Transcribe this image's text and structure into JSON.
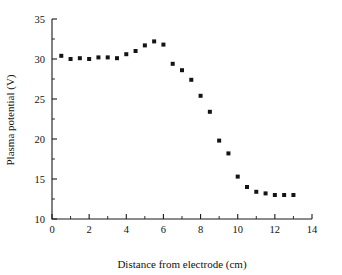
{
  "chart_data": {
    "type": "scatter",
    "title": "",
    "xlabel": "Distance from electrode (cm)",
    "ylabel": "Plasma potential (V)",
    "xlim": [
      0,
      14
    ],
    "ylim": [
      10,
      35
    ],
    "xticks": [
      0,
      2,
      4,
      6,
      8,
      10,
      12,
      14
    ],
    "yticks": [
      10,
      15,
      20,
      25,
      30,
      35
    ],
    "xtick_labels": [
      "0",
      "2",
      "4",
      "6",
      "8",
      "10",
      "12",
      "14"
    ],
    "ytick_labels": [
      "10",
      "15",
      "20",
      "25",
      "30",
      "35"
    ],
    "x_minor_step": 1,
    "y_minor_step": 2.5,
    "grid": false,
    "legend": null,
    "marker": "square",
    "marker_color": "#141414",
    "marker_size": 4,
    "series": [
      {
        "name": "Plasma potential",
        "x": [
          0.5,
          1.0,
          1.5,
          2.0,
          2.5,
          3.0,
          3.5,
          4.0,
          4.5,
          5.0,
          5.5,
          6.0,
          6.5,
          7.0,
          7.5,
          8.0,
          8.5,
          9.0,
          9.5,
          10.0,
          10.5,
          11.0,
          11.5,
          12.0,
          12.5,
          13.0
        ],
        "y": [
          30.4,
          30.0,
          30.1,
          30.0,
          30.2,
          30.2,
          30.1,
          30.6,
          31.0,
          31.7,
          32.2,
          31.8,
          29.4,
          28.6,
          27.4,
          25.4,
          23.4,
          19.8,
          18.2,
          15.3,
          14.0,
          13.4,
          13.2,
          13.0,
          13.0,
          13.0
        ]
      }
    ]
  },
  "axis_color": "#1a1a1a"
}
